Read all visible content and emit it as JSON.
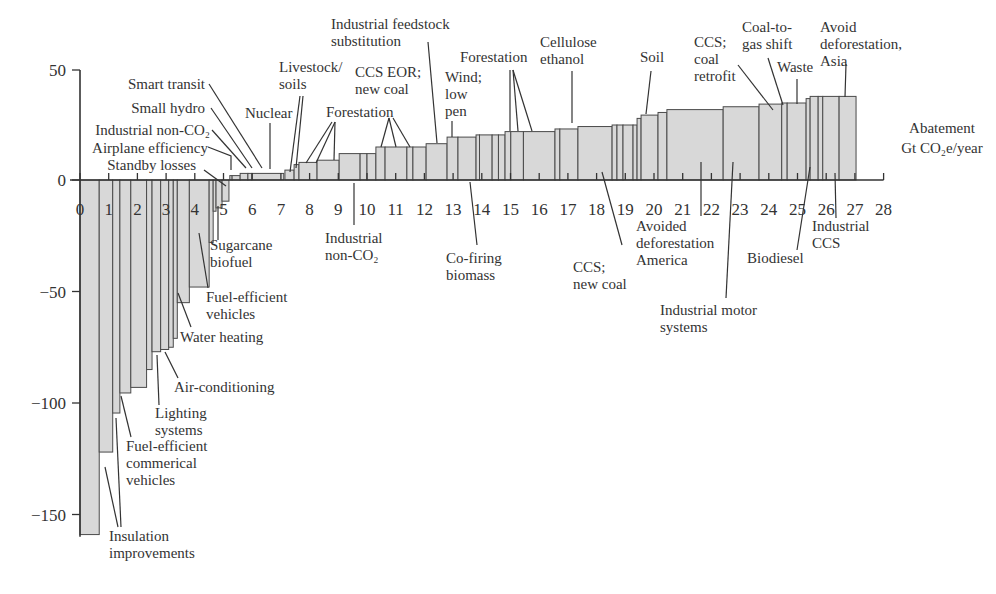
{
  "chart_data": {
    "type": "bar",
    "subtype": "marginal-abatement-cost-curve (variable-width bars)",
    "title": "",
    "xlabel": "Abatement Gt CO2e/year",
    "xlabel_lines": [
      "Abatement",
      "Gt CO₂e/year"
    ],
    "ylabel": "",
    "xlim": [
      0,
      28
    ],
    "ylim": [
      -160,
      50
    ],
    "x_ticks": [
      0,
      1,
      2,
      3,
      4,
      5,
      6,
      7,
      8,
      9,
      10,
      11,
      12,
      13,
      14,
      15,
      16,
      17,
      18,
      19,
      20,
      21,
      22,
      23,
      24,
      25,
      26,
      27,
      28
    ],
    "y_ticks": [
      50,
      0,
      -50,
      -100,
      -150
    ],
    "y_tick_labels": [
      "50",
      "0",
      "−50",
      "−100",
      "−150"
    ],
    "grid": false,
    "legend": null,
    "bars": [
      {
        "x0": 0.0,
        "x1": 0.67,
        "value": -159
      },
      {
        "x0": 0.67,
        "x1": 1.14,
        "value": -122
      },
      {
        "x0": 1.14,
        "x1": 1.39,
        "value": -104.5
      },
      {
        "x0": 1.39,
        "x1": 1.77,
        "value": -95.5
      },
      {
        "x0": 1.77,
        "x1": 2.32,
        "value": -93
      },
      {
        "x0": 2.32,
        "x1": 2.51,
        "value": -85
      },
      {
        "x0": 2.51,
        "x1": 2.81,
        "value": -77
      },
      {
        "x0": 2.81,
        "x1": 3.09,
        "value": -76
      },
      {
        "x0": 3.09,
        "x1": 3.25,
        "value": -75
      },
      {
        "x0": 3.25,
        "x1": 3.39,
        "value": -71
      },
      {
        "x0": 3.39,
        "x1": 3.81,
        "value": -55
      },
      {
        "x0": 3.81,
        "x1": 4.5,
        "value": -48
      },
      {
        "x0": 4.5,
        "x1": 4.64,
        "value": -28
      },
      {
        "x0": 4.64,
        "x1": 4.74,
        "value": -14
      },
      {
        "x0": 4.74,
        "x1": 4.95,
        "value": -12.5
      },
      {
        "x0": 4.95,
        "x1": 5.19,
        "value": -9.5
      },
      {
        "x0": 5.22,
        "x1": 5.3,
        "value": 2
      },
      {
        "x0": 5.3,
        "x1": 5.58,
        "value": 2
      },
      {
        "x0": 5.58,
        "x1": 5.85,
        "value": 3
      },
      {
        "x0": 5.85,
        "x1": 5.99,
        "value": 3
      },
      {
        "x0": 5.99,
        "x1": 7.1,
        "value": 3
      },
      {
        "x0": 7.14,
        "x1": 7.46,
        "value": 4.5
      },
      {
        "x0": 7.46,
        "x1": 7.63,
        "value": 7
      },
      {
        "x0": 7.63,
        "x1": 8.26,
        "value": 8
      },
      {
        "x0": 8.26,
        "x1": 9.03,
        "value": 9
      },
      {
        "x0": 9.03,
        "x1": 9.76,
        "value": 12
      },
      {
        "x0": 9.76,
        "x1": 10.0,
        "value": 12
      },
      {
        "x0": 10.0,
        "x1": 10.31,
        "value": 12
      },
      {
        "x0": 10.31,
        "x1": 10.63,
        "value": 15
      },
      {
        "x0": 10.63,
        "x1": 11.39,
        "value": 15
      },
      {
        "x0": 11.39,
        "x1": 11.6,
        "value": 15
      },
      {
        "x0": 11.6,
        "x1": 12.06,
        "value": 15
      },
      {
        "x0": 12.06,
        "x1": 12.79,
        "value": 16.5
      },
      {
        "x0": 12.79,
        "x1": 13.17,
        "value": 19.5
      },
      {
        "x0": 13.17,
        "x1": 13.8,
        "value": 19.5
      },
      {
        "x0": 13.8,
        "x1": 13.92,
        "value": 20.5
      },
      {
        "x0": 13.92,
        "x1": 14.36,
        "value": 20.5
      },
      {
        "x0": 14.36,
        "x1": 14.58,
        "value": 20.5
      },
      {
        "x0": 14.58,
        "x1": 14.81,
        "value": 20.5
      },
      {
        "x0": 14.81,
        "x1": 15.01,
        "value": 22
      },
      {
        "x0": 15.01,
        "x1": 15.45,
        "value": 22
      },
      {
        "x0": 15.45,
        "x1": 16.55,
        "value": 22
      },
      {
        "x0": 16.55,
        "x1": 16.72,
        "value": 23.2
      },
      {
        "x0": 16.72,
        "x1": 17.35,
        "value": 23.2
      },
      {
        "x0": 17.35,
        "x1": 18.54,
        "value": 24.3
      },
      {
        "x0": 18.54,
        "x1": 18.71,
        "value": 25
      },
      {
        "x0": 18.71,
        "x1": 18.92,
        "value": 25
      },
      {
        "x0": 18.92,
        "x1": 19.27,
        "value": 25
      },
      {
        "x0": 19.27,
        "x1": 19.41,
        "value": 25
      },
      {
        "x0": 19.41,
        "x1": 19.55,
        "value": 28
      },
      {
        "x0": 19.55,
        "x1": 20.14,
        "value": 29.5
      },
      {
        "x0": 20.14,
        "x1": 20.45,
        "value": 30.7
      },
      {
        "x0": 20.45,
        "x1": 22.41,
        "value": 32
      },
      {
        "x0": 22.41,
        "x1": 23.66,
        "value": 33.3
      },
      {
        "x0": 23.66,
        "x1": 24.45,
        "value": 34.5
      },
      {
        "x0": 24.45,
        "x1": 24.64,
        "value": 35
      },
      {
        "x0": 24.64,
        "x1": 25.3,
        "value": 35
      },
      {
        "x0": 25.3,
        "x1": 25.44,
        "value": 37
      },
      {
        "x0": 25.44,
        "x1": 25.72,
        "value": 38
      },
      {
        "x0": 25.72,
        "x1": 25.88,
        "value": 38
      },
      {
        "x0": 25.88,
        "x1": 26.45,
        "value": 38
      },
      {
        "x0": 26.45,
        "x1": 27.04,
        "value": 38
      }
    ],
    "annotations_above": [
      {
        "text": [
          "Smart transit"
        ],
        "anchor": "end",
        "tx": 205,
        "ty": 89,
        "leader": [
          [
            209,
            84
          ],
          [
            262,
            168
          ]
        ]
      },
      {
        "text": [
          "Small hydro"
        ],
        "anchor": "end",
        "tx": 205,
        "ty": 113,
        "leader": [
          [
            211,
            108
          ],
          [
            252,
            168
          ]
        ]
      },
      {
        "text": [
          "Industrial non-CO₂"
        ],
        "anchor": "end",
        "tx": 210,
        "ty": 135,
        "leader": [
          [
            212,
            130
          ],
          [
            246,
            168
          ]
        ]
      },
      {
        "text": [
          "Airplane efficiency"
        ],
        "anchor": "end",
        "tx": 208,
        "ty": 153,
        "leader": [
          [
            208,
            147
          ],
          [
            231,
            156
          ],
          [
            231,
            170
          ]
        ]
      },
      {
        "text": [
          "Standby losses"
        ],
        "anchor": "end",
        "tx": 196,
        "ty": 170,
        "leader": [
          [
            204,
            170
          ],
          [
            226,
            186
          ]
        ]
      },
      {
        "text": [
          "Nuclear"
        ],
        "anchor": "start",
        "tx": 245,
        "ty": 118,
        "leader": [
          [
            270,
            123
          ],
          [
            270,
            169
          ]
        ]
      },
      {
        "text": [
          "Livestock/",
          "soils"
        ],
        "anchor": "start",
        "tx": 279,
        "ty": 72,
        "leader": [
          [
            300,
            96
          ],
          [
            290,
            172
          ]
        ],
        "leader2": [
          [
            303,
            96
          ],
          [
            296,
            168
          ]
        ]
      },
      {
        "text": [
          "Forestation"
        ],
        "anchor": "start",
        "tx": 326,
        "ty": 117,
        "leader": [
          [
            332,
            122
          ],
          [
            306,
            163
          ]
        ],
        "leader2": [
          [
            335,
            122
          ],
          [
            316,
            163
          ]
        ],
        "leader3": [
          [
            335,
            122
          ],
          [
            334,
            160
          ]
        ]
      },
      {
        "text": [
          "CCS EOR;",
          "new coal"
        ],
        "anchor": "start",
        "tx": 355,
        "ty": 77,
        "leader": [
          [
            389,
            118
          ],
          [
            381,
            147
          ]
        ],
        "leader2": [
          [
            389,
            118
          ],
          [
            396,
            147
          ]
        ],
        "leader3": [
          [
            393,
            118
          ],
          [
            410,
            147
          ]
        ]
      },
      {
        "text": [
          "Industrial feedstock",
          "substitution"
        ],
        "anchor": "start",
        "tx": 331,
        "ty": 29,
        "leader": [
          [
            428,
            42
          ],
          [
            437,
            143
          ]
        ]
      },
      {
        "text": [
          "Wind;",
          "low",
          "pen"
        ],
        "anchor": "start",
        "tx": 445,
        "ty": 82,
        "leader": [
          [
            452,
            121
          ],
          [
            452,
            137
          ]
        ]
      },
      {
        "text": [
          "Forestation"
        ],
        "anchor": "start",
        "tx": 460,
        "ty": 62,
        "leader": [
          [
            510,
            70
          ],
          [
            510,
            131
          ]
        ],
        "leader2": [
          [
            513,
            70
          ],
          [
            518,
            131
          ]
        ],
        "leader3": [
          [
            513,
            70
          ],
          [
            532,
            131
          ]
        ]
      },
      {
        "text": [
          "Cellulose",
          "ethanol"
        ],
        "anchor": "start",
        "tx": 540,
        "ty": 47,
        "leader": [
          [
            572,
            71
          ],
          [
            572,
            123
          ]
        ]
      },
      {
        "text": [
          "Soil"
        ],
        "anchor": "start",
        "tx": 640,
        "ty": 62,
        "leader": [
          [
            651,
            71
          ],
          [
            646,
            114
          ]
        ]
      },
      {
        "text": [
          "CCS;",
          "coal",
          "retrofit"
        ],
        "anchor": "start",
        "tx": 694,
        "ty": 47,
        "leader": [
          [
            738,
            65
          ],
          [
            773,
            110
          ]
        ]
      },
      {
        "text": [
          "Coal-to-",
          "gas shift"
        ],
        "anchor": "start",
        "tx": 742,
        "ty": 32,
        "leader": [
          [
            768,
            58
          ],
          [
            783,
            105
          ]
        ]
      },
      {
        "text": [
          "Waste"
        ],
        "anchor": "start",
        "tx": 777,
        "ty": 72,
        "leader": [
          [
            797,
            79
          ],
          [
            797,
            104
          ]
        ]
      },
      {
        "text": [
          "Avoid",
          "deforestation,",
          "Asia"
        ],
        "anchor": "start",
        "tx": 820,
        "ty": 32,
        "leader": [
          [
            846,
            64
          ],
          [
            845,
            97
          ]
        ]
      }
    ],
    "annotations_below": [
      {
        "text": [
          "Sugarcane",
          "biofuel"
        ],
        "anchor": "start",
        "tx": 210,
        "ty": 250,
        "leader": [
          [
            218,
            206
          ],
          [
            218,
            240
          ]
        ]
      },
      {
        "text": [
          "Fuel-efficient",
          "vehicles"
        ],
        "anchor": "start",
        "tx": 206,
        "ty": 302,
        "leader": [
          [
            199,
            233
          ],
          [
            208,
            288
          ]
        ]
      },
      {
        "text": [
          "Water heating"
        ],
        "anchor": "start",
        "tx": 180,
        "ty": 342,
        "leader": [
          [
            178,
            293
          ],
          [
            191,
            327
          ]
        ]
      },
      {
        "text": [
          "Air-conditioning"
        ],
        "anchor": "start",
        "tx": 174,
        "ty": 392,
        "leader": [
          [
            165,
            352
          ],
          [
            178,
            378
          ]
        ]
      },
      {
        "text": [
          "Lighting",
          "systems"
        ],
        "anchor": "start",
        "tx": 155,
        "ty": 418,
        "leader": [
          [
            157,
            355
          ],
          [
            159,
            405
          ]
        ]
      },
      {
        "text": [
          "Fuel-efficient",
          "commerical",
          "vehicles"
        ],
        "anchor": "start",
        "tx": 126,
        "ty": 451,
        "leader": [
          [
            121,
            396
          ],
          [
            131,
            437
          ]
        ]
      },
      {
        "text": [
          "Insulation",
          "improvements"
        ],
        "anchor": "start",
        "tx": 109,
        "ty": 541,
        "leader": [
          [
            105,
            467
          ],
          [
            118,
            527
          ]
        ],
        "leader2": [
          [
            116,
            418
          ],
          [
            121,
            527
          ]
        ]
      },
      {
        "text": [
          "Industrial",
          "non-CO₂"
        ],
        "anchor": "start",
        "tx": 325,
        "ty": 243,
        "leader": [
          [
            354,
            183
          ],
          [
            354,
            225
          ]
        ]
      },
      {
        "text": [
          "Co-firing",
          "biomass"
        ],
        "anchor": "start",
        "tx": 446,
        "ty": 263,
        "leader": [
          [
            470,
            182
          ],
          [
            477,
            245
          ]
        ]
      },
      {
        "text": [
          "CCS;",
          "new coal"
        ],
        "anchor": "start",
        "tx": 573,
        "ty": 272,
        "leader": [
          [
            602,
            172
          ],
          [
            622,
            245
          ]
        ]
      },
      {
        "text": [
          "Avoided",
          "deforestation",
          "America"
        ],
        "anchor": "start",
        "tx": 636,
        "ty": 231,
        "leader": [
          [
            701,
            162
          ],
          [
            701,
            216
          ]
        ]
      },
      {
        "text": [
          "Industrial motor",
          "systems"
        ],
        "anchor": "start",
        "tx": 660,
        "ty": 315,
        "leader": [
          [
            733,
            162
          ],
          [
            726,
            298
          ]
        ]
      },
      {
        "text": [
          "Biodiesel"
        ],
        "anchor": "start",
        "tx": 747,
        "ty": 263,
        "leader": [
          [
            810,
            167
          ],
          [
            797,
            250
          ]
        ]
      },
      {
        "text": [
          "Industrial",
          "CCS"
        ],
        "anchor": "start",
        "tx": 812,
        "ty": 231,
        "leader": [
          [
            835,
            173
          ],
          [
            836,
            218
          ]
        ]
      }
    ]
  },
  "colors": {
    "bar_fill": "#d8d8d8",
    "bar_stroke": "#4a4a4a",
    "axis": "#333333",
    "text": "#333333"
  }
}
